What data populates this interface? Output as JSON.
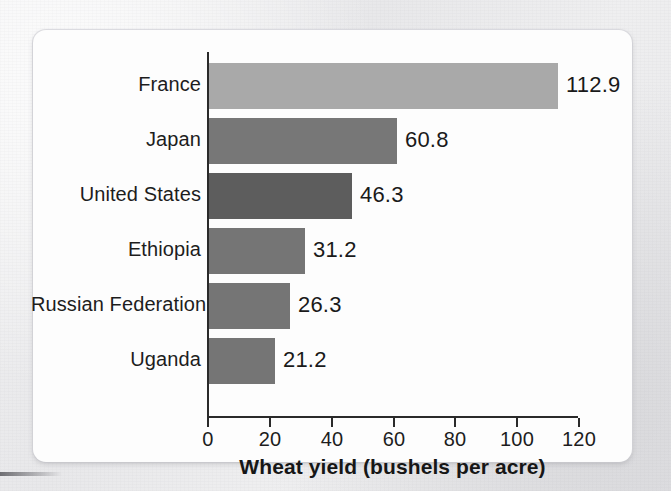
{
  "figure": {
    "background_color": "#efeff0",
    "card_color": "#fdfdfd",
    "axis_color": "#2a2a2a"
  },
  "chart_data": {
    "type": "bar",
    "orientation": "horizontal",
    "title": "",
    "xlabel": "Wheat yield (bushels per acre)",
    "ylabel": "",
    "categories": [
      "France",
      "Japan",
      "United States",
      "Ethiopia",
      "Russian Federation",
      "Uganda"
    ],
    "values": [
      112.9,
      60.8,
      46.3,
      31.2,
      26.3,
      21.2
    ],
    "value_labels": [
      "112.9",
      "60.8",
      "46.3",
      "31.2",
      "26.3",
      "21.2"
    ],
    "bar_colors": [
      "#a9a9a9",
      "#777777",
      "#5d5d5d",
      "#757575",
      "#757575",
      "#757575"
    ],
    "xlim": [
      0,
      120
    ],
    "xticks": [
      0,
      20,
      40,
      60,
      80,
      100,
      120
    ],
    "xtick_labels": [
      "0",
      "20",
      "40",
      "60",
      "80",
      "100",
      "120"
    ],
    "grid": false,
    "legend": false
  }
}
